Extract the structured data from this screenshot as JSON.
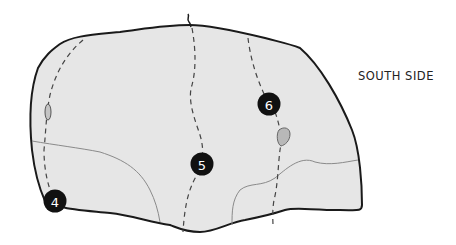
{
  "diagram": {
    "side_label": "SOUTH SIDE",
    "colors": {
      "boulder_fill": "#e6e6e6",
      "outline": "#1a1a1a",
      "route_line": "#444444",
      "feature_line": "#8a8a8a",
      "hold_fill": "#b8b8b8",
      "marker_fill": "#111111",
      "marker_text": "#ffffff"
    },
    "routes": [
      {
        "number": "4",
        "x": 55,
        "y": 201
      },
      {
        "number": "5",
        "x": 202,
        "y": 164
      },
      {
        "number": "6",
        "x": 269,
        "y": 104
      }
    ]
  }
}
